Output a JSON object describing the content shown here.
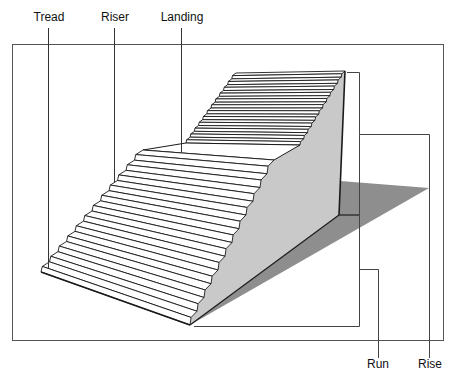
{
  "diagram": {
    "labels": {
      "tread": "Tread",
      "riser": "Riser",
      "landing": "Landing",
      "run": "Run",
      "rise": "Rise"
    },
    "flights": {
      "lower_step_count": 12,
      "upper_step_count": 12
    },
    "colors": {
      "tread_fill": "#ffffff",
      "side_face": "#c9c9c9",
      "shadow": "#8e8e8e",
      "edge": "#1a1a1a",
      "frame": "#555555"
    }
  }
}
